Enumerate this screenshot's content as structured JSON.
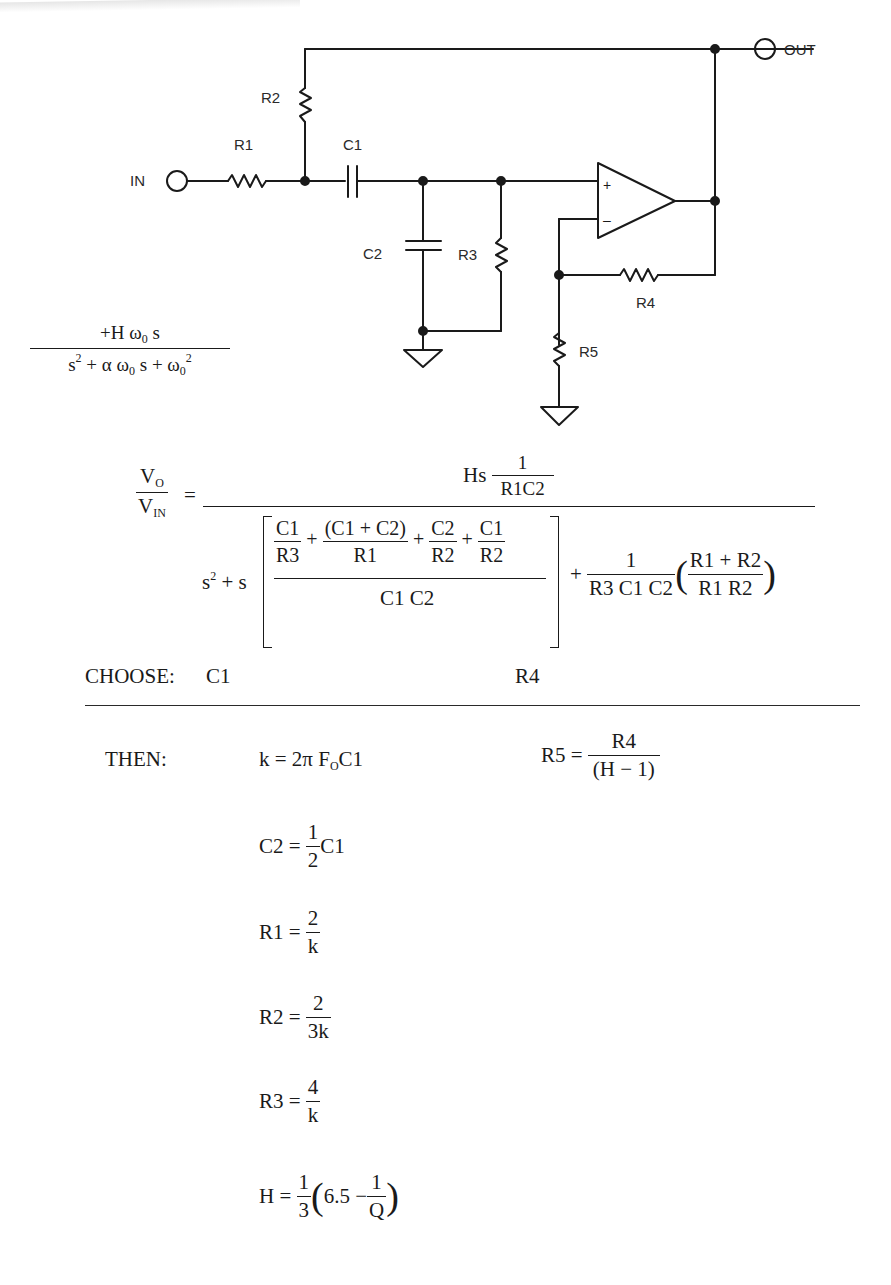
{
  "circuit": {
    "title": "Band-pass filter (Sallen-Key style, non-inverting op-amp)",
    "terminals": {
      "input": "IN",
      "output": "OUT"
    },
    "components": {
      "R1": "R1",
      "R2": "R2",
      "R3": "R3",
      "R4": "R4",
      "R5": "R5",
      "C1": "C1",
      "C2": "C2"
    },
    "opamp": {
      "plus": "+",
      "minus": "–"
    }
  },
  "generic_transfer": {
    "numerator": "+H ω₀ s",
    "denominator": "s² + α ω₀ s + ω₀²",
    "num_parts": {
      "a": "+H ω",
      "sub": "0",
      "b": " s"
    },
    "den_parts": {
      "s": "s",
      "sup2": "2",
      "plus_alpha": " + α ω",
      "sub0": "0",
      "s_plus": " s + ω",
      "sub0b": "0",
      "sup2b": "2"
    }
  },
  "specific_transfer": {
    "lhs_num": "V",
    "lhs_num_sub": "O",
    "lhs_den": "V",
    "lhs_den_sub": "IN",
    "equals": "=",
    "numerator_prefix": "Hs",
    "numerator_frac_num": "1",
    "numerator_frac_den": "R1C2",
    "den_s2": "s",
    "den_s2_sup": "2",
    "den_plus_s": " + s",
    "bracket_terms": [
      {
        "num": "C1",
        "den": "R3"
      },
      {
        "num": "(C1 + C2)",
        "den": "R1"
      },
      {
        "num": "C2",
        "den": "R2"
      },
      {
        "num": "C1",
        "den": "R2"
      }
    ],
    "bracket_plus": "+",
    "bracket_den": "C1 C2",
    "tail_plus": "+",
    "tail_frac_num": "1",
    "tail_frac_den": "R3 C1 C2",
    "tail_paren_num": "R1 + R2",
    "tail_paren_den": "R1 R2"
  },
  "choose": {
    "label": "CHOOSE:",
    "items": [
      "C1",
      "R4"
    ]
  },
  "then": {
    "label": "THEN:",
    "k": {
      "lhs": "k = 2π F",
      "sub": "O",
      "rhs": "C1"
    },
    "c2": {
      "lhs": "C2 =",
      "num": "1",
      "den": "2",
      "rhs": "C1"
    },
    "r1": {
      "lhs": "R1 =",
      "num": "2",
      "den": "k"
    },
    "r2": {
      "lhs": "R2 =",
      "num": "2",
      "den": "3k"
    },
    "r3": {
      "lhs": "R3 =",
      "num": "4",
      "den": "k"
    },
    "h": {
      "lhs": "H =",
      "num": "1",
      "den": "3",
      "inner_a": "6.5 −",
      "inner_num": "1",
      "inner_den": "Q"
    },
    "r5": {
      "lhs": "R5 =",
      "num": "R4",
      "den": "(H − 1)"
    }
  }
}
